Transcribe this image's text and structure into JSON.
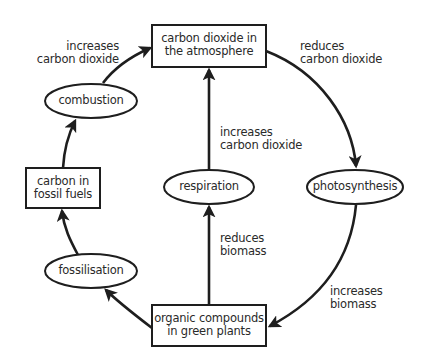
{
  "diagram": {
    "colors": {
      "stroke": "#1e1e1e",
      "text": "#2a2a2a",
      "background": "#ffffff"
    },
    "nodes": {
      "atmosphere": {
        "shape": "rect",
        "line1": "carbon dioxide in",
        "line2": "the atmosphere"
      },
      "photosynthesis": {
        "shape": "ellipse",
        "label": "photosynthesis"
      },
      "organic": {
        "shape": "rect",
        "line1": "organic compounds",
        "line2": "in green plants"
      },
      "respiration": {
        "shape": "ellipse",
        "label": "respiration"
      },
      "fossilisation": {
        "shape": "ellipse",
        "label": "fossilisation"
      },
      "fossil_fuels": {
        "shape": "rect",
        "line1": "carbon in",
        "line2": "fossil fuels"
      },
      "combustion": {
        "shape": "ellipse",
        "label": "combustion"
      }
    },
    "edges": {
      "atmosphere_to_photosynthesis": {
        "from": "atmosphere",
        "to": "photosynthesis",
        "line1": "reduces",
        "line2": "carbon dioxide"
      },
      "photosynthesis_to_organic": {
        "from": "photosynthesis",
        "to": "organic",
        "line1": "increases",
        "line2": "biomass"
      },
      "organic_to_respiration": {
        "from": "organic",
        "to": "respiration",
        "line1": "reduces",
        "line2": "biomass"
      },
      "respiration_to_atmosphere": {
        "from": "respiration",
        "to": "atmosphere",
        "line1": "increases",
        "line2": "carbon dioxide"
      },
      "organic_to_fossilisation": {
        "from": "organic",
        "to": "fossilisation"
      },
      "fossilisation_to_fossil_fuels": {
        "from": "fossilisation",
        "to": "fossil_fuels"
      },
      "fossil_fuels_to_combustion": {
        "from": "fossil_fuels",
        "to": "combustion"
      },
      "combustion_to_atmosphere": {
        "from": "combustion",
        "to": "atmosphere",
        "line1": "increases",
        "line2": "carbon dioxide"
      }
    }
  }
}
